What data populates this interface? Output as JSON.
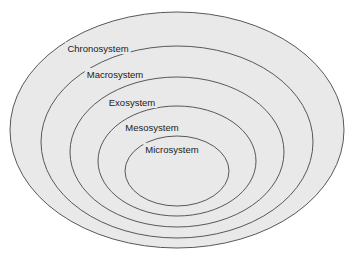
{
  "diagram": {
    "type": "nested-ellipses",
    "background_color": "#ffffff",
    "ring_fill_color": "#e9e9e9",
    "ring_stroke_color": "#58585a",
    "label_color": "#1a1a1a",
    "rings": [
      {
        "id": "chronosystem",
        "label": "Chronosystem",
        "level": 1,
        "cx": 177,
        "cy": 130,
        "rx": 167,
        "ry": 118,
        "label_x": 98,
        "label_y": 49
      },
      {
        "id": "macrosystem",
        "label": "Macrosystem",
        "level": 2,
        "cx": 177,
        "cy": 142,
        "rx": 136,
        "ry": 96,
        "label_x": 115,
        "label_y": 75
      },
      {
        "id": "exosystem",
        "label": "Exosystem",
        "level": 3,
        "cx": 177,
        "cy": 152,
        "rx": 107,
        "ry": 75,
        "label_x": 132,
        "label_y": 103
      },
      {
        "id": "mesosystem",
        "label": "Mesosystem",
        "level": 4,
        "cx": 177,
        "cy": 161,
        "rx": 79,
        "ry": 55,
        "label_x": 152,
        "label_y": 128
      },
      {
        "id": "microsystem",
        "label": "Microsystem",
        "level": 5,
        "cx": 177,
        "cy": 171,
        "rx": 52,
        "ry": 35,
        "label_x": 172,
        "label_y": 150
      }
    ]
  }
}
